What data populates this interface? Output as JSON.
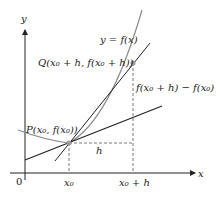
{
  "diagram": {
    "axis_labels": {
      "x": "x",
      "y": "y",
      "origin": "0"
    },
    "curve_label": "y = f(x)",
    "point_p_label": "P(x₀, f(x₀))",
    "point_q_label": "Q(x₀ + h, f(x₀ + h))",
    "rise_label": "f(x₀ + h) − f(x₀)",
    "run_label": "h",
    "tick_labels": {
      "x0": "x₀",
      "x0_plus_h": "x₀ + h"
    },
    "colors": {
      "curve": "#8a8a8a",
      "lines": "#222222",
      "points": "#9a9a9a"
    }
  }
}
